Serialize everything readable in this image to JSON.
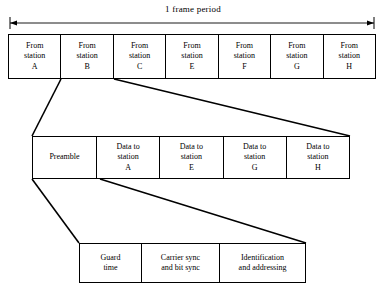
{
  "figure": {
    "frame_label": "1 frame period"
  },
  "frame_row": {
    "name": "frame-slots",
    "cells": [
      {
        "line1": "From",
        "line2": "station",
        "line3": "A"
      },
      {
        "line1": "From",
        "line2": "station",
        "line3": "B"
      },
      {
        "line1": "From",
        "line2": "station",
        "line3": "C"
      },
      {
        "line1": "From",
        "line2": "station",
        "line3": "E"
      },
      {
        "line1": "From",
        "line2": "station",
        "line3": "F"
      },
      {
        "line1": "From",
        "line2": "station",
        "line3": "G"
      },
      {
        "line1": "From",
        "line2": "station",
        "line3": "H"
      }
    ]
  },
  "burst_row": {
    "name": "burst-detail",
    "preamble": {
      "line1": "Preamble"
    },
    "cells": [
      {
        "line1": "Data to",
        "line2": "station",
        "line3": "A"
      },
      {
        "line1": "Data to",
        "line2": "station",
        "line3": "E"
      },
      {
        "line1": "Data to",
        "line2": "station",
        "line3": "G"
      },
      {
        "line1": "Data to",
        "line2": "station",
        "line3": "H"
      }
    ]
  },
  "preamble_row": {
    "name": "preamble-detail",
    "cells": [
      {
        "line1": "Guard",
        "line2": "time"
      },
      {
        "line1": "Carrier sync",
        "line2": "and bit sync"
      },
      {
        "line1": "Identification",
        "line2": "and addressing"
      }
    ]
  },
  "colors": {
    "stroke": "#000000",
    "background": "#ffffff"
  }
}
